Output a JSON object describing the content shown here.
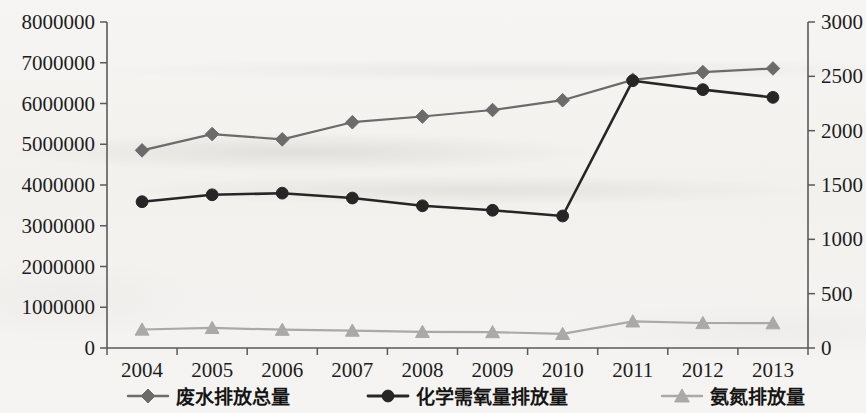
{
  "chart_data": {
    "type": "line",
    "title": "",
    "xlabel": "",
    "ylabel": "",
    "categories": [
      "2004",
      "2005",
      "2006",
      "2007",
      "2008",
      "2009",
      "2010",
      "2011",
      "2012",
      "2013"
    ],
    "grid": false,
    "legend_position": "bottom",
    "axes": {
      "left": {
        "min": 0,
        "max": 8000000,
        "step": 1000000,
        "ticks": [
          "0",
          "1000000",
          "2000000",
          "3000000",
          "4000000",
          "5000000",
          "6000000",
          "7000000",
          "8000000"
        ],
        "tick_values": [
          0,
          1000000,
          2000000,
          3000000,
          4000000,
          5000000,
          6000000,
          7000000,
          8000000
        ]
      },
      "right": {
        "min": 0,
        "max": 3000,
        "step": 500,
        "ticks": [
          "0",
          "500",
          "1000",
          "1500",
          "2000",
          "2500",
          "3000"
        ],
        "tick_values": [
          0,
          500,
          1000,
          1500,
          2000,
          2500,
          3000
        ]
      }
    },
    "series": [
      {
        "name": "废水排放总量",
        "marker": "diamond",
        "color": "#6b6b6b",
        "axis": "left",
        "values": [
          4850000,
          5250000,
          5120000,
          5540000,
          5680000,
          5840000,
          6080000,
          6580000,
          6770000,
          6860000
        ]
      },
      {
        "name": "化学需氧量排放量",
        "marker": "circle",
        "color": "#262626",
        "axis": "left",
        "values": [
          3590000,
          3760000,
          3800000,
          3680000,
          3490000,
          3380000,
          3240000,
          6560000,
          6340000,
          6150000
        ]
      },
      {
        "name": "氨氮排放量",
        "marker": "triangle",
        "color": "#a9a9a9",
        "axis": "right",
        "values": [
          170,
          185,
          168,
          160,
          148,
          146,
          130,
          245,
          230,
          228
        ]
      }
    ]
  },
  "legend": {
    "items": [
      {
        "label": "废水排放总量",
        "marker": "diamond",
        "color": "#6b6b6b"
      },
      {
        "label": "化学需氧量排放量",
        "marker": "circle",
        "color": "#262626"
      },
      {
        "label": "氨氮排放量",
        "marker": "triangle",
        "color": "#a9a9a9"
      }
    ]
  },
  "colors": {
    "series_wastewater": "#6b6b6b",
    "series_cod": "#262626",
    "series_ammonia": "#a9a9a9",
    "axis": "#5a5a5a",
    "text": "#1d1d1d",
    "background": "#f4f3f1"
  }
}
